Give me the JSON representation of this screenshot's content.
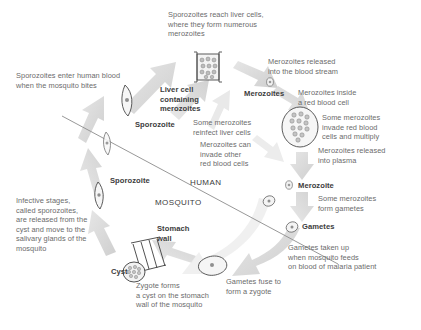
{
  "diagram": {
    "zones": [
      {
        "id": "human",
        "label": "HUMAN"
      },
      {
        "id": "mosquito",
        "label": "MOSQUITO"
      }
    ],
    "captions": [
      {
        "id": "sporozoites-reach-liver",
        "text": "Sporozoites reach liver cells,\nwhere they form numerous\nmerozoites"
      },
      {
        "id": "merozoites-released-blood",
        "text": "Merozoites released\ninto the blood stream"
      },
      {
        "id": "merozoites-inside-rbc",
        "text": "Merozoites inside\na red blood cell"
      },
      {
        "id": "some-merozoites-invade-rbc",
        "text": "Some merozoites\ninvade red blood\ncells and multiply"
      },
      {
        "id": "merozoites-released-plasma",
        "text": "Merozoites released\ninto plasma"
      },
      {
        "id": "some-merozoites-form-gametes",
        "text": "Some merozoites\nform gametes"
      },
      {
        "id": "gametes-taken-up",
        "text": "Gametes taken up\nwhen mosquito feeds\non blood of malaria patient"
      },
      {
        "id": "gametes-fuse",
        "text": "Gametes fuse to\nform a zygote"
      },
      {
        "id": "zygote-forms-cyst",
        "text": "Zygote forms\na cyst on the stomach\nwall of the mosquito"
      },
      {
        "id": "infective-stages",
        "text": "Infective stages,\ncalled sporozoites,\nare released from the\ncyst and move to the\nsalivary glands of the\nmosquito"
      },
      {
        "id": "sporozoites-enter-blood",
        "text": "Sporozoites enter human blood\nwhen the mosquito bites"
      },
      {
        "id": "some-merozoites-reinfect-liver",
        "text": "Some merozoites\nreinfect liver cells"
      },
      {
        "id": "merozoites-invade-other-rbc",
        "text": "Merozoites can\ninvade other\nred blood cells"
      }
    ],
    "labels": [
      {
        "id": "liver-cell",
        "text": "Liver cell\ncontaining\nmerozoites"
      },
      {
        "id": "merozoites-top",
        "text": "Merozoites"
      },
      {
        "id": "sporozoite-top",
        "text": "Sporozoite"
      },
      {
        "id": "sporozoite-left",
        "text": "Sporozoite"
      },
      {
        "id": "merozoite-right",
        "text": "Merozoite"
      },
      {
        "id": "gametes",
        "text": "Gametes"
      },
      {
        "id": "stomach-wall",
        "text": "Stomach\nwall"
      },
      {
        "id": "cyst",
        "text": "Cyst"
      }
    ],
    "colors": {
      "arrow_fill": "#d8d8d8",
      "arrow_fill_light": "#e4e4e4",
      "outline": "#555555",
      "caption_text": "#6b6b6b",
      "label_text": "#3c3c3c",
      "divider": "#8c8c8c"
    }
  }
}
